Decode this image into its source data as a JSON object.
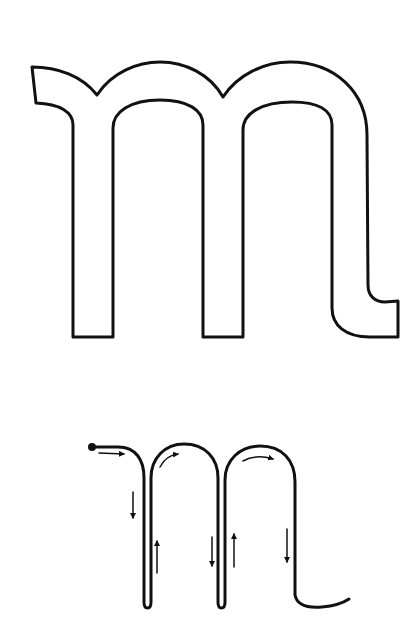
{
  "figure": {
    "description": "Handwriting guide for lowercase letter m: outline letterform and stroke-order diagram",
    "outline_letter": {
      "glyph": "m",
      "stroke_color": "#111111",
      "fill_color": "#ffffff"
    },
    "stroke_guide": {
      "glyph": "m",
      "stroke_color": "#111111",
      "start_marker": "start-dot",
      "arrows": [
        {
          "direction": "right",
          "segment": "entry-stroke"
        },
        {
          "direction": "down",
          "segment": "stem-1"
        },
        {
          "direction": "up",
          "segment": "retrace-stem-1"
        },
        {
          "direction": "clockwise-right",
          "segment": "arch-1"
        },
        {
          "direction": "down",
          "segment": "stem-2"
        },
        {
          "direction": "up",
          "segment": "retrace-stem-2"
        },
        {
          "direction": "clockwise-right",
          "segment": "arch-2"
        },
        {
          "direction": "down",
          "segment": "stem-3"
        }
      ]
    }
  }
}
